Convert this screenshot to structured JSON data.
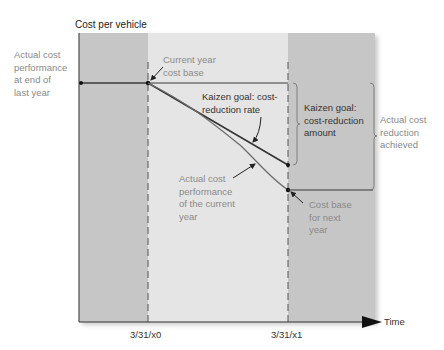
{
  "diagram": {
    "y_axis_title": "Cost per vehicle",
    "x_axis_title": "Time",
    "x_ticks": [
      "3/31/x0",
      "3/31/x1"
    ],
    "labels": {
      "prior_performance": "Actual cost\nperformance\nat end of\nlast year",
      "current_base": "Current year\ncost base",
      "kaizen_rate": "Kaizen goal: cost-\nreduction rate",
      "kaizen_amount": "Kaizen goal:\ncost-reduction\namount",
      "actual_reduction": "Actual cost\nreduction\nachieved",
      "actual_performance": "Actual cost\nperformance\nof the current\nyear",
      "next_base": "Cost base\nfor next\nyear"
    },
    "colors": {
      "outer_region": "#c8c8c8",
      "inner_region": "#e6e6e6",
      "line_dark": "#3a3a3a",
      "line_light": "#7a7a7a",
      "label_gray": "#8a8a8a"
    }
  }
}
